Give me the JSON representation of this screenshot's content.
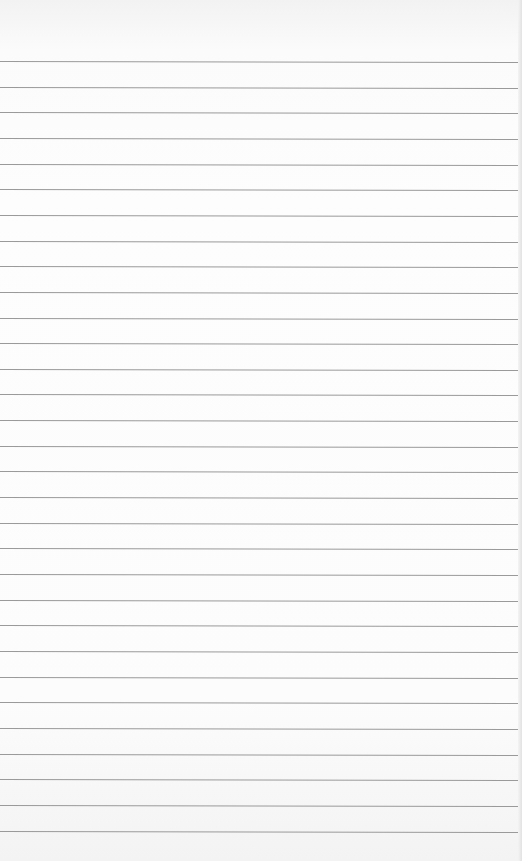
{
  "paper": {
    "type": "lined-paper",
    "line_count": 31,
    "first_line_y": 61,
    "line_spacing": 25.65,
    "line_color": "#9a9a9a",
    "background_color": "#fcfcfc"
  }
}
